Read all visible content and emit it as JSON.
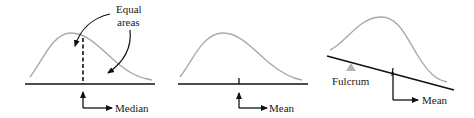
{
  "panels": [
    {
      "id": "median",
      "annotation_line1": "Equal",
      "annotation_line2": "areas",
      "pointer_label": "Median"
    },
    {
      "id": "mean",
      "pointer_label": "Mean"
    },
    {
      "id": "fulcrum",
      "fulcrum_label": "Fulcrum",
      "pointer_label": "Mean"
    }
  ],
  "colors": {
    "curve": "#aaaaaa",
    "axis": "#111111",
    "fulcrum": "#b3b3b3",
    "text": "#1a1a1a"
  }
}
